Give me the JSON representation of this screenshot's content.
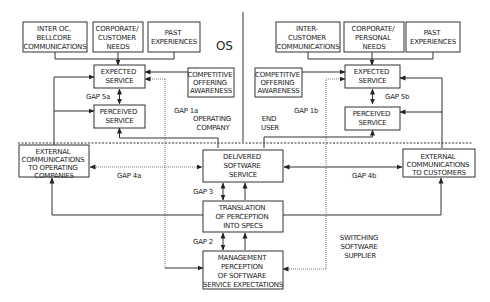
{
  "diagram": {
    "label_os": "OS",
    "operating_company": {
      "sources": [
        {
          "lines": [
            "INTER OC,",
            "BELLCORE",
            "COMMUNICATIONS"
          ]
        },
        {
          "lines": [
            "CORPORATE/",
            "CUSTOMER",
            "NEEDS"
          ]
        },
        {
          "lines": [
            "PAST",
            "EXPERIENCES"
          ]
        }
      ],
      "expected": [
        "EXPECTED",
        "SERVICE"
      ],
      "perceived": [
        "PERCEIVED",
        "SERVICE"
      ],
      "competitive": [
        "COMPETITIVE",
        "OFFERING",
        "AWARENESS"
      ],
      "gap5": "GAP 5a",
      "gap1": "GAP 1a",
      "region_label": [
        "OPERATING",
        "COMPANY"
      ]
    },
    "end_user": {
      "sources": [
        {
          "lines": [
            "INTER-",
            "CUSTOMER",
            "COMMUNICATIONS"
          ]
        },
        {
          "lines": [
            "CORPORATE/",
            "PERSONAL",
            "NEEDS"
          ]
        },
        {
          "lines": [
            "PAST",
            "EXPERIENCES"
          ]
        }
      ],
      "expected": [
        "EXPECTED",
        "SERVICE"
      ],
      "perceived": [
        "PERCEIVED",
        "SERVICE"
      ],
      "competitive": [
        "COMPETITIVE",
        "OFFERING",
        "AWARENESS"
      ],
      "gap5": "GAP 5b",
      "gap1": "GAP 1b",
      "region_label": [
        "END",
        "USER"
      ]
    },
    "supplier": {
      "delivered": [
        "DELIVERED",
        "SOFTWARE",
        "SERVICE"
      ],
      "translation": [
        "TRANSLATION",
        "OF PERCEPTION",
        "INTO SPECS"
      ],
      "management": [
        "MANAGEMENT",
        "PERCEPTION",
        "OF SOFTWARE",
        "SERVICE EXPECTATIONS"
      ],
      "ext_oc": [
        "EXTERNAL",
        "COMMUNICATIONS",
        "TO OPERATING",
        "COMPANIES"
      ],
      "ext_cust": [
        "EXTERNAL",
        "COMMUNICATIONS",
        "TO CUSTOMERS"
      ],
      "gap4a": "GAP 4a",
      "gap4b": "GAP 4b",
      "gap3": "GAP 3",
      "gap2": "GAP 2",
      "region_label": [
        "SWITCHING",
        "SOFTWARE",
        "SUPPLIER"
      ]
    }
  }
}
